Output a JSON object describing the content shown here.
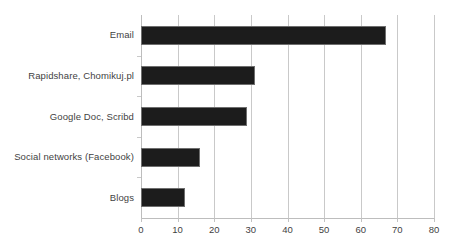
{
  "chart_data": {
    "type": "bar",
    "orientation": "horizontal",
    "title": "",
    "subtitle": "",
    "xlabel": "",
    "ylabel": "",
    "categories": [
      "Email",
      "Rapidshare, Chomikuj.pl",
      "Google Doc, Scribd",
      "Social networks (Facebook)",
      "Blogs"
    ],
    "values": [
      67,
      31,
      29,
      16,
      12
    ],
    "xlim": [
      0,
      80
    ],
    "xticks": [
      0,
      10,
      20,
      30,
      40,
      50,
      60,
      70,
      80
    ],
    "xtick_labels": [
      "0",
      "10",
      "20",
      "30",
      "40",
      "50",
      "60",
      "70",
      "80"
    ],
    "grid": "vertical",
    "legend": "none",
    "bar_color": "#1c1c1c",
    "bar_border_color": "#6e6e6e",
    "gridline_color": "#c9c9c9",
    "axis_color": "#bdbdbd",
    "label_color": "#3f3f3f",
    "background_color": "#ffffff"
  }
}
